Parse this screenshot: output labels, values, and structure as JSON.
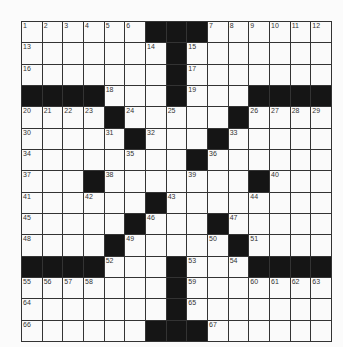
{
  "puzzle": {
    "rows": 15,
    "cols": 15,
    "layout": [
      "......###......",
      ".......#.......",
      ".......#.......",
      "####...#...####",
      "....#.....#....",
      ".....#...#.....",
      "........#......",
      "...#.......#...",
      "......#........",
      ".....#...#.....",
      "....#.....#....",
      "####...#...####",
      ".......#.......",
      ".......#.......",
      "......###......"
    ],
    "numbers": [
      {
        "r": 0,
        "c": 0,
        "n": "1"
      },
      {
        "r": 0,
        "c": 1,
        "n": "2"
      },
      {
        "r": 0,
        "c": 2,
        "n": "3"
      },
      {
        "r": 0,
        "c": 3,
        "n": "4"
      },
      {
        "r": 0,
        "c": 4,
        "n": "5"
      },
      {
        "r": 0,
        "c": 5,
        "n": "6"
      },
      {
        "r": 0,
        "c": 9,
        "n": "7"
      },
      {
        "r": 0,
        "c": 10,
        "n": "8"
      },
      {
        "r": 0,
        "c": 11,
        "n": "9"
      },
      {
        "r": 0,
        "c": 12,
        "n": "10"
      },
      {
        "r": 0,
        "c": 13,
        "n": "11"
      },
      {
        "r": 0,
        "c": 14,
        "n": "12"
      },
      {
        "r": 1,
        "c": 0,
        "n": "13"
      },
      {
        "r": 1,
        "c": 6,
        "n": "14"
      },
      {
        "r": 1,
        "c": 8,
        "n": "15"
      },
      {
        "r": 2,
        "c": 0,
        "n": "16"
      },
      {
        "r": 2,
        "c": 8,
        "n": "17"
      },
      {
        "r": 3,
        "c": 4,
        "n": "18"
      },
      {
        "r": 3,
        "c": 8,
        "n": "19"
      },
      {
        "r": 4,
        "c": 0,
        "n": "20"
      },
      {
        "r": 4,
        "c": 1,
        "n": "21"
      },
      {
        "r": 4,
        "c": 2,
        "n": "22"
      },
      {
        "r": 4,
        "c": 3,
        "n": "23"
      },
      {
        "r": 4,
        "c": 5,
        "n": "24"
      },
      {
        "r": 4,
        "c": 7,
        "n": "25"
      },
      {
        "r": 4,
        "c": 11,
        "n": "26"
      },
      {
        "r": 4,
        "c": 12,
        "n": "27"
      },
      {
        "r": 4,
        "c": 13,
        "n": "28"
      },
      {
        "r": 4,
        "c": 14,
        "n": "29"
      },
      {
        "r": 5,
        "c": 0,
        "n": "30"
      },
      {
        "r": 5,
        "c": 4,
        "n": "31"
      },
      {
        "r": 5,
        "c": 6,
        "n": "32"
      },
      {
        "r": 5,
        "c": 10,
        "n": "33"
      },
      {
        "r": 6,
        "c": 0,
        "n": "34"
      },
      {
        "r": 6,
        "c": 5,
        "n": "35"
      },
      {
        "r": 6,
        "c": 9,
        "n": "36"
      },
      {
        "r": 7,
        "c": 0,
        "n": "37"
      },
      {
        "r": 7,
        "c": 4,
        "n": "38"
      },
      {
        "r": 7,
        "c": 8,
        "n": "39"
      },
      {
        "r": 7,
        "c": 12,
        "n": "40"
      },
      {
        "r": 8,
        "c": 0,
        "n": "41"
      },
      {
        "r": 8,
        "c": 3,
        "n": "42"
      },
      {
        "r": 8,
        "c": 7,
        "n": "43"
      },
      {
        "r": 8,
        "c": 11,
        "n": "44"
      },
      {
        "r": 9,
        "c": 0,
        "n": "45"
      },
      {
        "r": 9,
        "c": 6,
        "n": "46"
      },
      {
        "r": 9,
        "c": 10,
        "n": "47"
      },
      {
        "r": 10,
        "c": 0,
        "n": "48"
      },
      {
        "r": 10,
        "c": 5,
        "n": "49"
      },
      {
        "r": 10,
        "c": 9,
        "n": "50"
      },
      {
        "r": 10,
        "c": 11,
        "n": "51"
      },
      {
        "r": 11,
        "c": 4,
        "n": "52"
      },
      {
        "r": 11,
        "c": 8,
        "n": "53"
      },
      {
        "r": 11,
        "c": 10,
        "n": "54"
      },
      {
        "r": 12,
        "c": 0,
        "n": "55"
      },
      {
        "r": 12,
        "c": 1,
        "n": "56"
      },
      {
        "r": 12,
        "c": 2,
        "n": "57"
      },
      {
        "r": 12,
        "c": 3,
        "n": "58"
      },
      {
        "r": 12,
        "c": 8,
        "n": "59"
      },
      {
        "r": 12,
        "c": 11,
        "n": "60"
      },
      {
        "r": 12,
        "c": 12,
        "n": "61"
      },
      {
        "r": 12,
        "c": 13,
        "n": "62"
      },
      {
        "r": 12,
        "c": 14,
        "n": "63"
      },
      {
        "r": 13,
        "c": 0,
        "n": "64"
      },
      {
        "r": 13,
        "c": 8,
        "n": "65"
      },
      {
        "r": 14,
        "c": 0,
        "n": "66"
      },
      {
        "r": 14,
        "c": 9,
        "n": "67"
      }
    ],
    "colors": {
      "black_cell": "#151515",
      "white_cell": "#fafafa",
      "grid_line": "#333333"
    }
  }
}
